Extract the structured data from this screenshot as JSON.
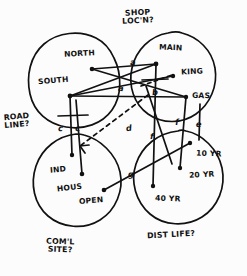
{
  "diagram": {
    "ink_color": "#111111",
    "paper_color": "#fcfcfc",
    "groups": [
      {
        "id": "shop-loc",
        "label": "SHOP\nLOC'N?",
        "x": 122,
        "y": 9
      },
      {
        "id": "road-line",
        "label": "ROAD\nLINE?",
        "x": 4,
        "y": 113
      },
      {
        "id": "coml-site",
        "label": "COM'L\nSITE?",
        "x": 46,
        "y": 238
      },
      {
        "id": "dist-life",
        "label": "DIST LIFE?",
        "x": 147,
        "y": 231
      }
    ],
    "nodes": [
      {
        "id": "north",
        "label": "NORTH",
        "lx": 64,
        "ly": 50,
        "dx": 92,
        "dy": 69
      },
      {
        "id": "south",
        "label": "SOUTH",
        "lx": 38,
        "ly": 77,
        "dx": 70,
        "dy": 96
      },
      {
        "id": "main",
        "label": "MAIN",
        "lx": 159,
        "ly": 44,
        "dx": 156,
        "dy": 64
      },
      {
        "id": "king",
        "label": "KING",
        "lx": 181,
        "ly": 68,
        "dx": 173,
        "dy": 76
      },
      {
        "id": "gas",
        "label": "GAS",
        "lx": 192,
        "ly": 92,
        "dx": 186,
        "dy": 97
      },
      {
        "id": "ind",
        "label": "IND",
        "lx": 50,
        "ly": 166,
        "dx": 72,
        "dy": 155
      },
      {
        "id": "hous",
        "label": "HOUS",
        "lx": 57,
        "ly": 184,
        "dx": 82,
        "dy": 174
      },
      {
        "id": "open",
        "label": "OPEN",
        "lx": 79,
        "ly": 197,
        "dx": 104,
        "dy": 190
      },
      {
        "id": "yr10",
        "label": "10 YR",
        "lx": 196,
        "ly": 150,
        "dx": 190,
        "dy": 143
      },
      {
        "id": "yr20",
        "label": "20 YR",
        "lx": 189,
        "ly": 171,
        "dx": 180,
        "dy": 168
      },
      {
        "id": "yr40",
        "label": "40 YR",
        "lx": 155,
        "ly": 195,
        "dx": 153,
        "dy": 186
      }
    ],
    "edge_labels": [
      {
        "id": "a-upper",
        "label": "a",
        "x": 130,
        "y": 58
      },
      {
        "id": "a-lower",
        "label": "a",
        "x": 118,
        "y": 84
      },
      {
        "id": "b",
        "label": "b",
        "x": 152,
        "y": 88
      },
      {
        "id": "c-left",
        "label": "c",
        "x": 58,
        "y": 124
      },
      {
        "id": "c-right",
        "label": "c",
        "x": 75,
        "y": 124
      },
      {
        "id": "d",
        "label": "d",
        "x": 126,
        "y": 124
      },
      {
        "id": "e",
        "label": "e",
        "x": 196,
        "y": 120
      },
      {
        "id": "f-right",
        "label": "f",
        "x": 175,
        "y": 118
      },
      {
        "id": "f-left",
        "label": "f",
        "x": 150,
        "y": 132
      },
      {
        "id": "g",
        "label": "g",
        "x": 128,
        "y": 170
      }
    ]
  }
}
